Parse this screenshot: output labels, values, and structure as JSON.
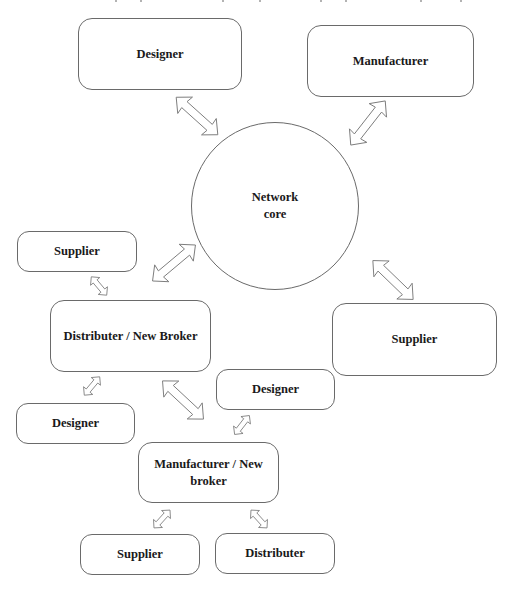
{
  "diagram": {
    "type": "network",
    "center": {
      "id": "core",
      "label_line1": "Network",
      "label_line2": "core"
    },
    "nodes": [
      {
        "id": "designer_top",
        "label": "Designer"
      },
      {
        "id": "manufacturer_top",
        "label": "Manufacturer"
      },
      {
        "id": "supplier_left",
        "label": "Supplier"
      },
      {
        "id": "distributer_broker",
        "label": "Distributer / New Broker"
      },
      {
        "id": "supplier_right",
        "label": "Supplier"
      },
      {
        "id": "designer_mid",
        "label": "Designer"
      },
      {
        "id": "designer_left",
        "label": "Designer"
      },
      {
        "id": "manufacturer_broker",
        "label_line1": "Manufacturer / New",
        "label_line2": "broker"
      },
      {
        "id": "supplier_bottom",
        "label": "Supplier"
      },
      {
        "id": "distributer_bottom",
        "label": "Distributer"
      }
    ],
    "edges": [
      {
        "from": "designer_top",
        "to": "core",
        "style": "double-arrow-large"
      },
      {
        "from": "manufacturer_top",
        "to": "core",
        "style": "double-arrow-large"
      },
      {
        "from": "distributer_broker",
        "to": "core",
        "style": "double-arrow-large"
      },
      {
        "from": "supplier_right",
        "to": "core",
        "style": "double-arrow-large"
      },
      {
        "from": "supplier_left",
        "to": "distributer_broker",
        "style": "double-arrow-small"
      },
      {
        "from": "distributer_broker",
        "to": "designer_left",
        "style": "double-arrow-small"
      },
      {
        "from": "distributer_broker",
        "to": "manufacturer_broker",
        "style": "double-arrow-large"
      },
      {
        "from": "designer_mid",
        "to": "manufacturer_broker",
        "style": "double-arrow-small"
      },
      {
        "from": "manufacturer_broker",
        "to": "supplier_bottom",
        "style": "double-arrow-small"
      },
      {
        "from": "manufacturer_broker",
        "to": "distributer_bottom",
        "style": "double-arrow-small"
      }
    ]
  }
}
